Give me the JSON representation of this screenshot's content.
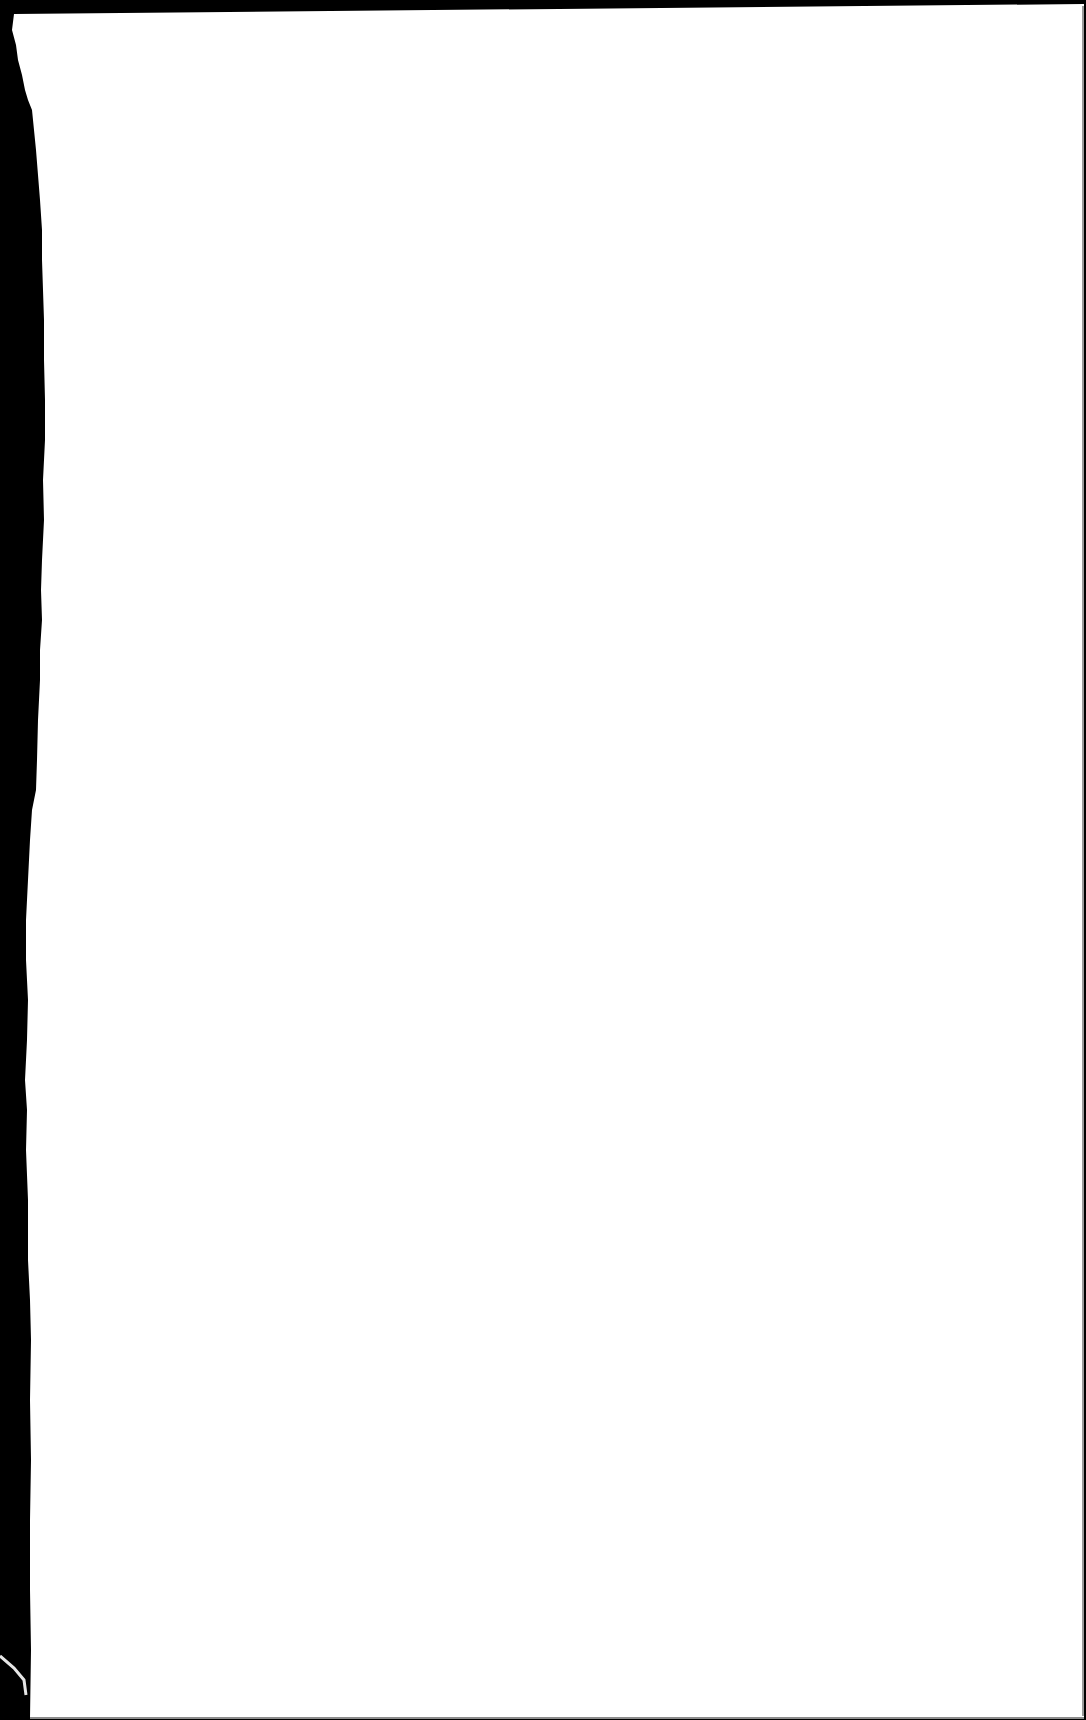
{
  "document": {
    "type": "blank-scanned-page",
    "text_content": [],
    "background_color": "#000000",
    "paper_color": "#ffffff",
    "top_border_color": "#111111",
    "right_edge_line_color": "#9a9a9a",
    "bottom_edge_line_color": "#8c8c8c",
    "fiber_color": "#e6e6e6"
  }
}
